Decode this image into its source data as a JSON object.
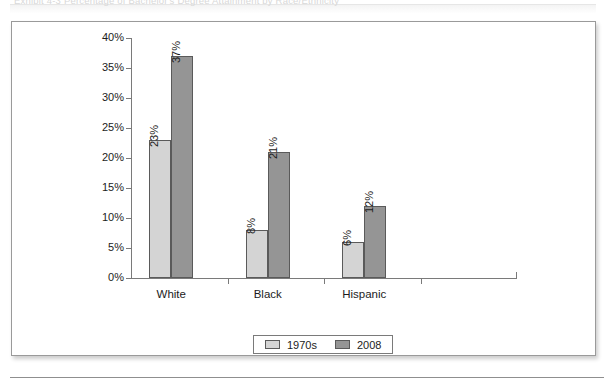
{
  "page": {
    "caption_ghost": "Exhibit 4-3   Percentage of Bachelor's Degree Attainment by Race/Ethnicity"
  },
  "chart_data": {
    "type": "bar",
    "title": "",
    "xlabel": "",
    "ylabel": "",
    "categories": [
      "White",
      "Black",
      "Hispanic",
      ""
    ],
    "series": [
      {
        "name": "1970s",
        "values": [
          23,
          8,
          6,
          null
        ],
        "color": "#d4d4d4"
      },
      {
        "name": "2008",
        "values": [
          37,
          21,
          12,
          null
        ],
        "color": "#959595"
      }
    ],
    "value_labels": [
      [
        "23%",
        "8%",
        "6%",
        ""
      ],
      [
        "37%",
        "21%",
        "12%",
        ""
      ]
    ],
    "ylim": [
      0,
      40
    ],
    "ytick_values": [
      0,
      5,
      10,
      15,
      20,
      25,
      30,
      35,
      40
    ],
    "ytick_labels": [
      "0%",
      "5%",
      "10%",
      "15%",
      "20%",
      "25%",
      "30%",
      "35%",
      "40%"
    ],
    "grid": false,
    "legend_position": "bottom-center",
    "value_label_rotation": -90,
    "unit": "percent"
  },
  "legend": {
    "items": [
      {
        "label": "1970s",
        "color": "#d4d4d4"
      },
      {
        "label": "2008",
        "color": "#959595"
      }
    ]
  },
  "colors": {
    "series_1970s": "#d4d4d4",
    "series_2008": "#959595",
    "bar_outline": "#5a5a5a",
    "axis": "#7a7a7a",
    "card_border": "#9a9a9a",
    "text": "#1c1c1c"
  }
}
